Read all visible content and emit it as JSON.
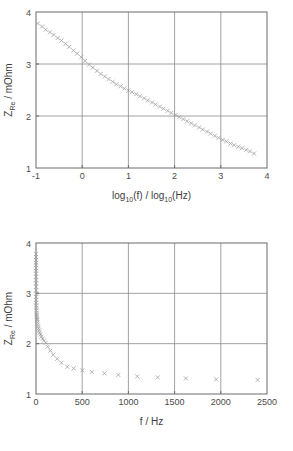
{
  "figure": {
    "background": "#ffffff",
    "marker_color": "#9a9a9a",
    "axis_color": "#6b6b6b",
    "grid_color": "#8a8a8a"
  },
  "chart_data": [
    {
      "type": "scatter",
      "title": "",
      "xlabel": "log10(f) / log10(Hz)",
      "xlabel_parts": {
        "a": "log",
        "a_sub": "10",
        "b": "(f) / log",
        "b_sub": "10",
        "c": "(Hz)"
      },
      "ylabel": "ZRe / mOhm",
      "ylabel_parts": {
        "a": "Z",
        "a_sub": "Re",
        "b": " / mOhm"
      },
      "xlim": [
        -1,
        4
      ],
      "ylim": [
        1,
        4
      ],
      "xticks": [
        -1,
        0,
        1,
        2,
        3,
        4
      ],
      "xticklabels": [
        "-1",
        "0",
        "1",
        "2",
        "3",
        "4"
      ],
      "yticks": [
        1,
        2,
        3,
        4
      ],
      "yticklabels": [
        "1",
        "2",
        "3",
        "4"
      ],
      "grid": true,
      "grid_x": [
        0,
        1,
        2,
        3
      ],
      "grid_y": [
        2,
        3
      ],
      "marker": "x",
      "x": [
        -0.96,
        -0.87,
        -0.79,
        -0.7,
        -0.62,
        -0.53,
        -0.45,
        -0.36,
        -0.28,
        -0.19,
        -0.11,
        -0.02,
        0.06,
        0.15,
        0.23,
        0.32,
        0.4,
        0.49,
        0.57,
        0.66,
        0.74,
        0.83,
        0.91,
        1.0,
        1.08,
        1.17,
        1.25,
        1.34,
        1.42,
        1.51,
        1.59,
        1.68,
        1.76,
        1.85,
        1.93,
        2.02,
        2.1,
        2.19,
        2.27,
        2.36,
        2.44,
        2.53,
        2.61,
        2.7,
        2.78,
        2.87,
        2.95,
        3.04,
        3.12,
        3.21,
        3.29,
        3.38,
        3.46,
        3.55,
        3.63,
        3.72
      ],
      "y": [
        3.78,
        3.72,
        3.66,
        3.61,
        3.56,
        3.5,
        3.45,
        3.39,
        3.33,
        3.26,
        3.2,
        3.13,
        3.06,
        2.99,
        2.93,
        2.87,
        2.81,
        2.76,
        2.71,
        2.66,
        2.61,
        2.57,
        2.53,
        2.49,
        2.46,
        2.42,
        2.38,
        2.34,
        2.3,
        2.26,
        2.22,
        2.18,
        2.14,
        2.1,
        2.06,
        2.02,
        1.98,
        1.94,
        1.9,
        1.86,
        1.82,
        1.78,
        1.74,
        1.7,
        1.66,
        1.62,
        1.58,
        1.54,
        1.51,
        1.47,
        1.44,
        1.41,
        1.38,
        1.35,
        1.32,
        1.28
      ]
    },
    {
      "type": "scatter",
      "title": "",
      "xlabel": "f / Hz",
      "ylabel": "ZRe / mOhm",
      "ylabel_parts": {
        "a": "Z",
        "a_sub": "Re",
        "b": " / mOhm"
      },
      "xlim": [
        0,
        2500
      ],
      "ylim": [
        1,
        4
      ],
      "xticks": [
        0,
        500,
        1000,
        1500,
        2000,
        2500
      ],
      "xticklabels": [
        "0",
        "500",
        "1000",
        "1500",
        "2000",
        "2500"
      ],
      "yticks": [
        1,
        2,
        3,
        4
      ],
      "yticklabels": [
        "1",
        "2",
        "3",
        "4"
      ],
      "grid": true,
      "grid_x": [
        500,
        1000,
        1500,
        2000
      ],
      "grid_y": [
        2,
        3
      ],
      "marker": "x",
      "x": [
        0.11,
        0.13,
        0.16,
        0.2,
        0.24,
        0.3,
        0.35,
        0.44,
        0.52,
        0.65,
        0.78,
        0.95,
        1.15,
        1.41,
        1.7,
        2.09,
        2.51,
        3.09,
        3.72,
        4.57,
        5.5,
        6.76,
        8.13,
        10.0,
        12.0,
        14.8,
        17.8,
        21.9,
        26.3,
        32.4,
        38.9,
        47.9,
        57.5,
        70.8,
        85.1,
        105,
        126,
        155,
        186,
        229,
        275,
        339,
        407,
        501,
        603,
        741,
        891,
        1096,
        1318,
        1622,
        1950,
        2399
      ],
      "y": [
        3.78,
        3.72,
        3.66,
        3.61,
        3.56,
        3.5,
        3.45,
        3.39,
        3.33,
        3.26,
        3.2,
        3.13,
        3.06,
        2.99,
        2.93,
        2.87,
        2.81,
        2.76,
        2.71,
        2.66,
        2.61,
        2.57,
        2.53,
        2.49,
        2.46,
        2.42,
        2.38,
        2.34,
        2.3,
        2.26,
        2.22,
        2.18,
        2.14,
        2.1,
        2.06,
        2.02,
        1.94,
        1.86,
        1.78,
        1.7,
        1.62,
        1.54,
        1.51,
        1.47,
        1.44,
        1.41,
        1.38,
        1.35,
        1.33,
        1.31,
        1.29,
        1.28
      ]
    }
  ]
}
